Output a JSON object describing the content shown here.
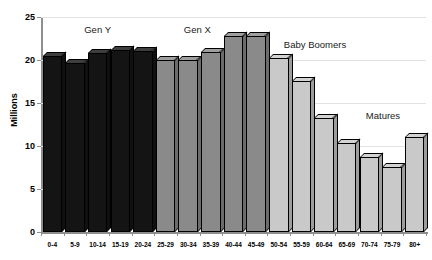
{
  "chart_data": {
    "type": "bar",
    "title": "",
    "xlabel": "",
    "ylabel": "Millions",
    "ylim": [
      0,
      25
    ],
    "yticks": [
      0,
      5,
      10,
      15,
      20,
      25
    ],
    "ytick_labels": [
      "0",
      "5",
      "10",
      "15",
      "20",
      "25"
    ],
    "grid": true,
    "legend_position": "none",
    "categories": [
      "0-4",
      "5-9",
      "10-14",
      "15-19",
      "20-24",
      "25-29",
      "30-34",
      "35-39",
      "40-44",
      "45-49",
      "50-54",
      "55-59",
      "60-64",
      "65-69",
      "70-74",
      "75-79",
      "80+"
    ],
    "values": [
      20.5,
      19.6,
      20.8,
      21.2,
      21.0,
      20.0,
      20.0,
      20.9,
      22.8,
      22.8,
      20.2,
      17.6,
      13.3,
      10.4,
      8.7,
      7.6,
      11.0
    ],
    "bar_colors": [
      "#141414",
      "#141414",
      "#141414",
      "#141414",
      "#141414",
      "#8a8a8a",
      "#8a8a8a",
      "#8a8a8a",
      "#8a8a8a",
      "#8a8a8a",
      "#c9c9c9",
      "#c9c9c9",
      "#c9c9c9",
      "#c9c9c9",
      "#c9c9c9",
      "#c9c9c9",
      "#c9c9c9"
    ],
    "annotations": [
      {
        "text": "Gen Y",
        "x_value": 2.0,
        "y_value": 23.6
      },
      {
        "text": "Gen X",
        "x_value": 6.4,
        "y_value": 23.6
      },
      {
        "text": "Baby Boomers",
        "x_value": 11.6,
        "y_value": 21.9
      },
      {
        "text": "Matures",
        "x_value": 14.6,
        "y_value": 13.6
      }
    ],
    "groups": [
      {
        "name": "Gen Y",
        "color": "#141414",
        "start_index": 0,
        "end_index": 4
      },
      {
        "name": "Gen X",
        "color": "#8a8a8a",
        "start_index": 5,
        "end_index": 9
      },
      {
        "name": "Baby Boomers",
        "color": "#c9c9c9",
        "start_index": 10,
        "end_index": 14
      },
      {
        "name": "Matures",
        "color": "#c9c9c9",
        "start_index": 15,
        "end_index": 16
      }
    ]
  },
  "colors": {
    "axis": "#8e8e8e",
    "gridline": "#e2e2e2",
    "text": "#000000",
    "background": "#ffffff",
    "bar_outline": "#000000"
  }
}
